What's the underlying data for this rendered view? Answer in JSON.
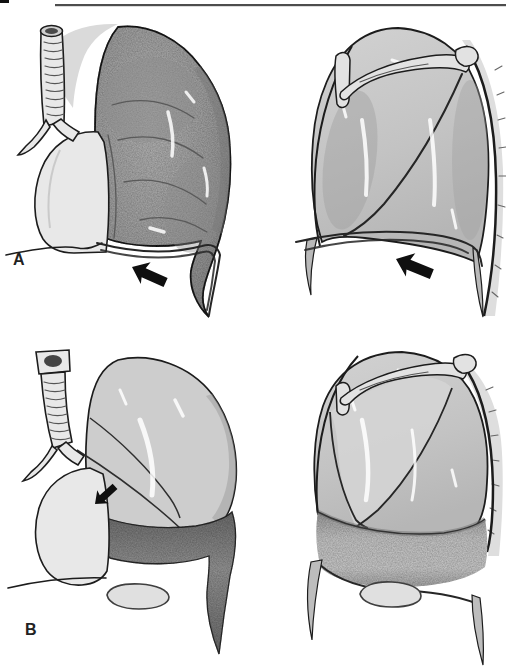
{
  "figure": {
    "panel_a_label": "A",
    "panel_b_label": "B"
  },
  "icons": {
    "panel_a_arrow": "thick-arrow-up-left",
    "panel_top_right_arrow": "thick-arrow-up-left",
    "panel_b_arrow": "small-arrow-down-left"
  },
  "palette": {
    "paper": "#ffffff",
    "ink": "#1c1c1c",
    "rule": "#4d4d4d",
    "arrow": "#0f0f0f",
    "label": "#222222"
  }
}
